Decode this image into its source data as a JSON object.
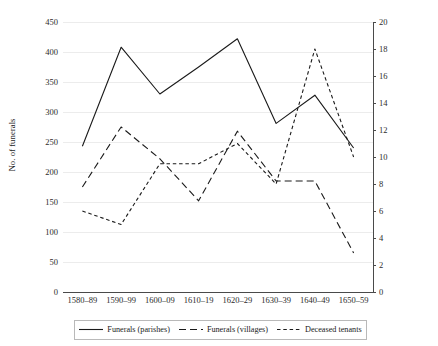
{
  "chart_data": {
    "type": "line",
    "title": "",
    "xlabel": "",
    "ylabel": "No. of funerals",
    "y2label": "No. of deceased tenants",
    "categories": [
      "1580–89",
      "1590–99",
      "1600–09",
      "1610–19",
      "1620–29",
      "1630–39",
      "1640–49",
      "1650–59"
    ],
    "ylim": [
      0,
      450
    ],
    "y2lim": [
      0,
      20
    ],
    "yticks": [
      0,
      50,
      100,
      150,
      200,
      250,
      300,
      350,
      400,
      450
    ],
    "y2ticks": [
      0,
      2,
      4,
      6,
      8,
      10,
      12,
      14,
      16,
      18,
      20
    ],
    "grid": true,
    "legend_position": "bottom",
    "series": [
      {
        "name": "Funerals (parishes)",
        "axis": "left",
        "style": "solid",
        "color": "#1a1a1a",
        "values": [
          243,
          408,
          330,
          375,
          422,
          281,
          328,
          240
        ]
      },
      {
        "name": "Funerals (villages)",
        "axis": "left",
        "style": "long-dash",
        "color": "#1a1a1a",
        "values": [
          175,
          275,
          222,
          152,
          268,
          185,
          185,
          65
        ]
      },
      {
        "name": "Deceased tenants",
        "axis": "right",
        "style": "short-dash",
        "color": "#1a1a1a",
        "values": [
          6,
          5,
          9.5,
          9.5,
          11,
          8,
          18,
          10
        ]
      }
    ]
  },
  "axes": {
    "left_title": "No. of funerals",
    "right_title": "No. of deceased tenants",
    "left_ticks": [
      "450",
      "400",
      "350",
      "300",
      "250",
      "200",
      "150",
      "100",
      "50",
      "0"
    ],
    "right_ticks": [
      "20",
      "18",
      "16",
      "14",
      "12",
      "10",
      "8",
      "6",
      "4",
      "2",
      "0"
    ]
  },
  "legend": {
    "items": [
      {
        "label": "Funerals (parishes)",
        "style": "solid"
      },
      {
        "label": "Funerals (villages)",
        "style": "long-dash"
      },
      {
        "label": "Deceased tenants",
        "style": "short-dash"
      }
    ]
  }
}
